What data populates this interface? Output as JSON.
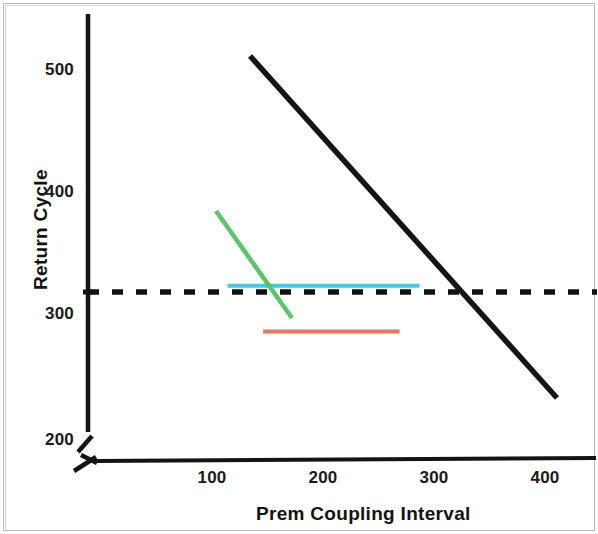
{
  "chart_data": {
    "type": "line",
    "title": "",
    "xlabel": "Prem Coupling Interval",
    "ylabel": "Return Cycle",
    "xlim": [
      0,
      430
    ],
    "ylim": [
      185,
      535
    ],
    "x_ticks": [
      100,
      200,
      300,
      400
    ],
    "y_ticks": [
      200,
      300,
      400,
      500
    ],
    "grid": false,
    "legend": "none",
    "axis_break": "both",
    "series": [
      {
        "name": "black-solid-line",
        "color": "#1a1a1a",
        "style": "solid",
        "width": 5,
        "points": [
          [
            134,
            512
          ],
          [
            410,
            237
          ]
        ]
      },
      {
        "name": "green-solid-line",
        "color": "#5cc46a",
        "style": "solid",
        "width": 4,
        "points": [
          [
            104,
            385
          ],
          [
            171,
            300
          ]
        ]
      },
      {
        "name": "cyan-horizontal-line",
        "color": "#4ec3e8",
        "style": "solid",
        "width": 4,
        "points": [
          [
            114,
            325
          ],
          [
            287,
            325
          ]
        ]
      },
      {
        "name": "orange-horizontal-line",
        "color": "#f0735c",
        "style": "solid",
        "width": 4,
        "points": [
          [
            146,
            288
          ],
          [
            269,
            288
          ]
        ]
      },
      {
        "name": "black-dashed-reference-line",
        "color": "#111111",
        "style": "dashed",
        "width": 5,
        "points": [
          [
            0,
            320
          ],
          [
            430,
            320
          ]
        ]
      }
    ]
  },
  "axes": {
    "y_tick_labels": [
      "500",
      "400",
      "300",
      "200"
    ],
    "x_tick_labels": [
      "100",
      "200",
      "300",
      "400"
    ],
    "y_title": "Return Cycle",
    "x_title": "Prem Coupling Interval"
  }
}
